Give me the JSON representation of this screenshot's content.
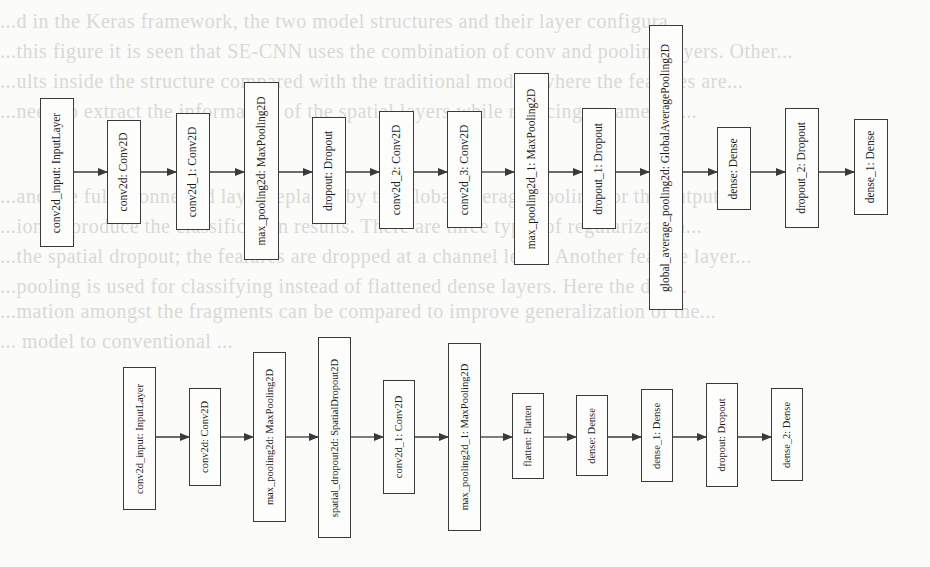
{
  "figure": {
    "background_color": "#fbfbf9",
    "border_color": "#3a3a3a",
    "edge_color": "#3a3a3a"
  },
  "models": [
    {
      "name": "model-a",
      "center_y": 172,
      "layers": [
        {
          "label": "conv2d_input: InputLayer",
          "x": 40,
          "y": 98,
          "w": 34,
          "h": 149
        },
        {
          "label": "conv2d: Conv2D",
          "x": 107,
          "y": 120,
          "w": 34,
          "h": 104
        },
        {
          "label": "conv2d_1: Conv2D",
          "x": 176,
          "y": 113,
          "w": 34,
          "h": 117
        },
        {
          "label": "max_pooling2d: MaxPooling2D",
          "x": 244,
          "y": 82,
          "w": 35,
          "h": 178
        },
        {
          "label": "dropout: Dropout",
          "x": 312,
          "y": 117,
          "w": 34,
          "h": 107
        },
        {
          "label": "conv2d_2: Conv2D",
          "x": 379,
          "y": 111,
          "w": 35,
          "h": 118
        },
        {
          "label": "conv2d_3: Conv2D",
          "x": 447,
          "y": 111,
          "w": 35,
          "h": 117
        },
        {
          "label": "max_pooling2d_1: MaxPooling2D",
          "x": 514,
          "y": 73,
          "w": 35,
          "h": 192
        },
        {
          "label": "dropout_1: Dropout",
          "x": 582,
          "y": 108,
          "w": 34,
          "h": 121
        },
        {
          "label": "global_average_pooling2d: GlobalAveragePooling2D",
          "x": 649,
          "y": 25,
          "w": 34,
          "h": 285
        },
        {
          "label": "dense: Dense",
          "x": 717,
          "y": 127,
          "w": 34,
          "h": 83
        },
        {
          "label": "dropout_2: Dropout",
          "x": 785,
          "y": 108,
          "w": 34,
          "h": 120
        },
        {
          "label": "dense_1: Dense",
          "x": 854,
          "y": 119,
          "w": 34,
          "h": 96
        }
      ]
    },
    {
      "name": "model-b",
      "center_y": 437,
      "layers": [
        {
          "label": "conv2d_input: InputLayer",
          "x": 123,
          "y": 367,
          "w": 33,
          "h": 143
        },
        {
          "label": "conv2d: Conv2D",
          "x": 189,
          "y": 388,
          "w": 32,
          "h": 98
        },
        {
          "label": "max_pooling2d: MaxPooling2D",
          "x": 253,
          "y": 352,
          "w": 33,
          "h": 170
        },
        {
          "label": "spatial_dropout2d: SpatialDropout2D",
          "x": 318,
          "y": 337,
          "w": 33,
          "h": 201
        },
        {
          "label": "conv2d_1: Conv2D",
          "x": 383,
          "y": 380,
          "w": 32,
          "h": 114
        },
        {
          "label": "max_pooling2d_1: MaxPooling2D",
          "x": 448,
          "y": 343,
          "w": 33,
          "h": 188
        },
        {
          "label": "flatten: Flatten",
          "x": 512,
          "y": 393,
          "w": 32,
          "h": 86
        },
        {
          "label": "dense: Dense",
          "x": 576,
          "y": 395,
          "w": 32,
          "h": 81
        },
        {
          "label": "dense_1: Dense",
          "x": 641,
          "y": 389,
          "w": 32,
          "h": 93
        },
        {
          "label": "dropout: Dropout",
          "x": 706,
          "y": 383,
          "w": 32,
          "h": 104
        },
        {
          "label": "dense_2: Dense",
          "x": 771,
          "y": 388,
          "w": 32,
          "h": 93
        }
      ]
    }
  ],
  "background_bleed_lines": [
    {
      "y": 10,
      "text": "...d in the Keras framework, the two model structures and their layer configura..."
    },
    {
      "y": 40,
      "text": "...this figure it is seen that SE-CNN uses the combination of conv and pooling layers. Other..."
    },
    {
      "y": 70,
      "text": "...ults inside the structure compared with the traditional model, where the features are..."
    },
    {
      "y": 100,
      "text": "...need to extract the information of the spatial layers while reducing parameters..."
    },
    {
      "y": 185,
      "text": "...and the fully connected layer replaced by the global average pooling for the output..."
    },
    {
      "y": 215,
      "text": "...ion to produce the classification results. There are three types of regularization..."
    },
    {
      "y": 245,
      "text": "...the spatial dropout; the features are dropped at a channel level. Another feature layer..."
    },
    {
      "y": 275,
      "text": "...pooling is used for classifying instead of flattened dense layers. Here the diff..."
    },
    {
      "y": 300,
      "text": "...mation amongst the fragments can be compared to improve generalization of the..."
    },
    {
      "y": 330,
      "text": "...                                     model to conventional ..."
    }
  ]
}
